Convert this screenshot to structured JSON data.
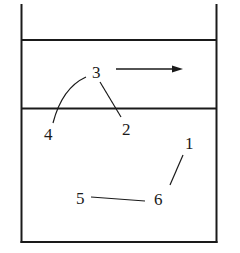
{
  "diagram": {
    "colors": {
      "line": "#1a1a1a",
      "background": "#ffffff"
    },
    "labels": [
      {
        "id": "1",
        "text": "1",
        "x": 187,
        "y": 151
      },
      {
        "id": "2",
        "text": "2",
        "x": 127,
        "y": 135
      },
      {
        "id": "3",
        "text": "3",
        "x": 98,
        "y": 74
      },
      {
        "id": "4",
        "text": "4",
        "x": 49,
        "y": 138
      },
      {
        "id": "5",
        "text": "5",
        "x": 81,
        "y": 204
      },
      {
        "id": "6",
        "text": "6",
        "x": 159,
        "y": 206
      }
    ],
    "arrow": {
      "direction": "right",
      "from": [
        116,
        69
      ],
      "to": [
        182,
        69
      ]
    },
    "leader_lines": [
      {
        "from_label": "3",
        "to_label": "4"
      },
      {
        "from_label": "3",
        "to_label": "2"
      },
      {
        "from_label": "1",
        "to_label": "6"
      },
      {
        "from_label": "5",
        "to_label": "6"
      }
    ]
  }
}
